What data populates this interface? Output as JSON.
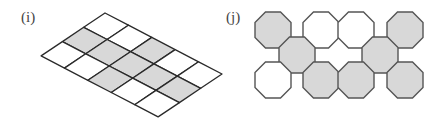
{
  "figures": [
    {
      "label": "(i)",
      "type": "parallelogram-grid",
      "rows": 3,
      "cols": 5,
      "shaded_cells": [
        [
          1,
          0
        ],
        [
          1,
          1
        ],
        [
          1,
          2
        ],
        [
          1,
          3
        ],
        [
          1,
          4
        ],
        [
          0,
          2
        ],
        [
          2,
          2
        ]
      ]
    },
    {
      "label": "(j)",
      "type": "octagon-arrangement",
      "octagons": [
        {
          "cx": 273,
          "cy": 30,
          "shaded": true
        },
        {
          "cx": 321,
          "cy": 30,
          "shaded": false
        },
        {
          "cx": 356,
          "cy": 30,
          "shaded": false
        },
        {
          "cx": 405,
          "cy": 30,
          "shaded": true
        },
        {
          "cx": 297,
          "cy": 55,
          "shaded": true
        },
        {
          "cx": 380,
          "cy": 55,
          "shaded": true
        },
        {
          "cx": 273,
          "cy": 80,
          "shaded": false
        },
        {
          "cx": 321,
          "cy": 80,
          "shaded": true
        },
        {
          "cx": 356,
          "cy": 80,
          "shaded": true
        },
        {
          "cx": 405,
          "cy": 80,
          "shaded": true
        }
      ]
    }
  ],
  "colors": {
    "shade": "#d8d8d8",
    "stroke": "#2a2a2a",
    "octagon_stroke": "#555555",
    "background": "#ffffff"
  }
}
